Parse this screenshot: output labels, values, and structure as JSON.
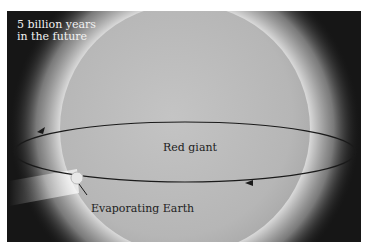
{
  "figure": {
    "caption": "5 billion years in the future",
    "caption_lines": [
      "5 billion years",
      "in the future"
    ],
    "labels": {
      "star": "Red giant",
      "planet": "Evaporating Earth"
    },
    "colors": {
      "background": "#111111",
      "star_surface": "#bdbdbd",
      "corona": "#e6e6e6",
      "orbit": "#1a1a1a",
      "caption_text": "#f2f2f2",
      "label_text": "#222222"
    }
  }
}
